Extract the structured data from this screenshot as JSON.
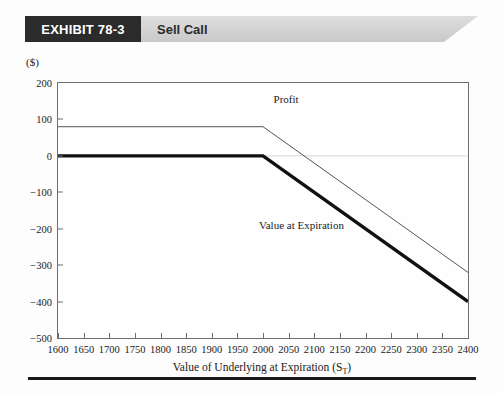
{
  "header": {
    "exhibit_tag": "EXHIBIT 78-3",
    "title": "Sell Call"
  },
  "chart_data": {
    "type": "line",
    "title": "Sell Call",
    "xlabel": "Value of Underlying at Expiration (S",
    "xlabel_sub": "T",
    "xlabel_end": ")",
    "ylabel": "($)",
    "xlim": [
      1600,
      2400
    ],
    "ylim": [
      -500,
      200
    ],
    "xticks": [
      1600,
      1650,
      1700,
      1750,
      1800,
      1850,
      1900,
      1950,
      2000,
      2050,
      2100,
      2150,
      2200,
      2250,
      2300,
      2350,
      2400
    ],
    "yticks": [
      200,
      100,
      0,
      -100,
      -200,
      -300,
      -400,
      -500
    ],
    "grid": false,
    "zero_reference_line": 0,
    "strike": 2000,
    "premium": 80,
    "legend_position": "inline-annotations",
    "series": [
      {
        "name": "Profit",
        "style": "thin",
        "color": "#555555",
        "label_x": 2045,
        "label_y": 155,
        "points": [
          {
            "x": 1600,
            "y": 80
          },
          {
            "x": 2000,
            "y": 80
          },
          {
            "x": 2400,
            "y": -320
          }
        ]
      },
      {
        "name": "Value at Expiration",
        "style": "thick",
        "color": "#111111",
        "label_x": 2075,
        "label_y": -190,
        "points": [
          {
            "x": 1600,
            "y": 0
          },
          {
            "x": 2000,
            "y": 0
          },
          {
            "x": 2400,
            "y": -400
          }
        ]
      }
    ]
  }
}
